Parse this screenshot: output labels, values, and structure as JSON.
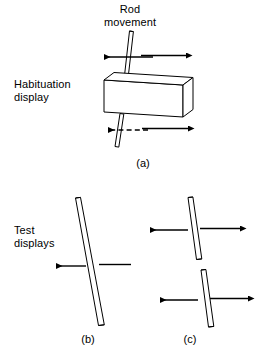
{
  "figure": {
    "background_color": "#ffffff",
    "line_color": "#000000",
    "width": 261,
    "height": 351
  },
  "labels": {
    "rod_movement": "Rod\nmovement",
    "habituation_display": "Habituation\ndisplay",
    "test_displays": "Test\ndisplays",
    "panel_a": "(a)",
    "panel_b": "(b)",
    "panel_c": "(c)"
  },
  "panels": [
    {
      "id": "a",
      "label": "(a)",
      "title": "Habituation display",
      "elements": [
        {
          "name": "rod",
          "type": "outlined-rod",
          "orientation": "tilted",
          "occluded_by": "box"
        },
        {
          "name": "occluder-box",
          "type": "3d-rectangular-prism"
        },
        {
          "name": "arrow-top-left",
          "type": "arrow",
          "direction": "left",
          "style": "solid"
        },
        {
          "name": "arrow-top-right",
          "type": "arrow",
          "direction": "right",
          "style": "solid"
        },
        {
          "name": "arrow-bottom-left",
          "type": "arrow",
          "direction": "left",
          "style": "dashed"
        },
        {
          "name": "arrow-bottom-right",
          "type": "arrow",
          "direction": "right",
          "style": "solid"
        }
      ]
    },
    {
      "id": "b",
      "label": "(b)",
      "title": "Test displays",
      "elements": [
        {
          "name": "rod",
          "type": "outlined-rod",
          "orientation": "tilted",
          "occluded_by": "none"
        },
        {
          "name": "arrow-left",
          "type": "arrow",
          "direction": "left",
          "style": "solid"
        },
        {
          "name": "line-right",
          "type": "line",
          "direction": "none",
          "style": "solid"
        }
      ]
    },
    {
      "id": "c",
      "label": "(c)",
      "title": "Test displays",
      "elements": [
        {
          "name": "rod-upper",
          "type": "outlined-rod",
          "orientation": "tilted"
        },
        {
          "name": "rod-lower",
          "type": "outlined-rod",
          "orientation": "tilted"
        },
        {
          "name": "arrow-upper-left",
          "type": "arrow",
          "direction": "left",
          "style": "solid"
        },
        {
          "name": "arrow-upper-right",
          "type": "arrow",
          "direction": "right",
          "style": "solid"
        },
        {
          "name": "arrow-lower-left",
          "type": "arrow",
          "direction": "left",
          "style": "solid"
        },
        {
          "name": "arrow-lower-right",
          "type": "arrow",
          "direction": "right",
          "style": "solid"
        }
      ]
    }
  ]
}
